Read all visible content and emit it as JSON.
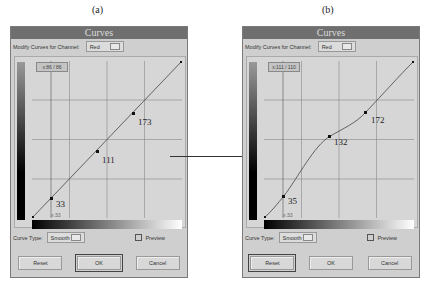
{
  "captions": {
    "a": "(a)",
    "b": "(b)"
  },
  "dialogs": [
    {
      "title": "Curves",
      "channel_label": "Modify Curves for Channel:",
      "channel_value": "Red",
      "coord": "x:86 / 86",
      "x_label": "x:33",
      "curve_type_label": "Curve Type:",
      "curve_type_value": "Smooth",
      "preview_label": "Preview",
      "buttons": {
        "reset": "Reset",
        "ok": "OK",
        "cancel": "Cancel"
      },
      "default_button": "ok",
      "points": [
        {
          "x": 0,
          "y": 0
        },
        {
          "x": 33,
          "y": 33,
          "label": "33"
        },
        {
          "x": 111,
          "y": 111,
          "label": "111"
        },
        {
          "x": 173,
          "y": 173,
          "label": "173"
        },
        {
          "x": 255,
          "y": 255
        }
      ]
    },
    {
      "title": "Curves",
      "channel_label": "Modify Curves for Channel:",
      "channel_value": "Red",
      "coord": "x:111 / 110",
      "x_label": "x:33",
      "curve_type_label": "Curve Type:",
      "curve_type_value": "Smooth",
      "preview_label": "Preview",
      "buttons": {
        "reset": "Reset",
        "ok": "OK",
        "cancel": "Cancel"
      },
      "default_button": "reset",
      "points": [
        {
          "x": 0,
          "y": 0
        },
        {
          "x": 33,
          "y": 35,
          "label": "35"
        },
        {
          "x": 111,
          "y": 132,
          "label": "132"
        },
        {
          "x": 173,
          "y": 172,
          "label": "172"
        },
        {
          "x": 255,
          "y": 255
        }
      ]
    }
  ]
}
